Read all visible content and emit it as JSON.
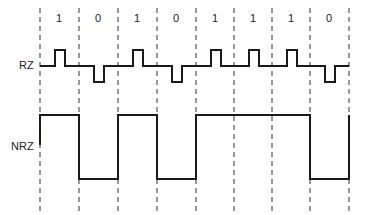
{
  "diagram": {
    "bits": [
      "1",
      "0",
      "1",
      "0",
      "1",
      "1",
      "1",
      "0"
    ],
    "signals": [
      {
        "name": "RZ",
        "label": "RZ"
      },
      {
        "name": "NRZ",
        "label": "NRZ"
      }
    ],
    "colors": {
      "line": "#1a1a1a",
      "dash": "#333333",
      "text": "#222222"
    }
  }
}
